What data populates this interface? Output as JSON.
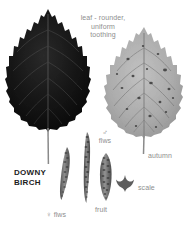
{
  "plate": {
    "subject": "DOWNY BIRCH",
    "background": "#ffffff",
    "text_color": "#8e8e8e",
    "title_color": "#1c1c1c",
    "dark_leaf_color": "#141414",
    "autumn_leaf_color": "#a9a9a9",
    "catkin_color": "#6f6f6f"
  },
  "title": {
    "line1": "DOWNY",
    "line2": "BIRCH"
  },
  "annotations": {
    "leaf_note": "leaf - rounder,\nuniform\ntoothing",
    "autumn": "autumn",
    "male_symbol": "♂",
    "male_flws": "flws",
    "female_symbol": "♀",
    "female_flws": "flws",
    "fruit": "fruit",
    "scale": "scale"
  },
  "figures": [
    {
      "name": "summer-leaf",
      "label": "dark green summer leaf"
    },
    {
      "name": "autumn-leaf",
      "label": "autumn"
    },
    {
      "name": "female-catkin",
      "label": "♀ flws"
    },
    {
      "name": "male-catkin",
      "label": "♂ flws"
    },
    {
      "name": "fruit-catkin",
      "label": "fruit"
    },
    {
      "name": "seed-scale",
      "label": "scale"
    }
  ]
}
